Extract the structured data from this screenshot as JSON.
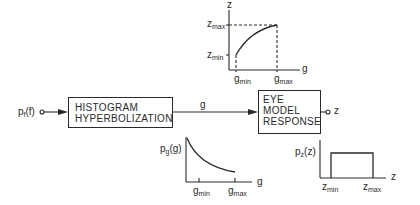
{
  "diagram": {
    "input": {
      "label_main": "p",
      "label_sub": "f",
      "label_arg": "(f)"
    },
    "block1": {
      "line1": "HISTOGRAM",
      "line2": "HYPERBOLIZATION"
    },
    "signal_g": "g",
    "block2": {
      "line1": "EYE",
      "line2": "MODEL",
      "line3": "RESPONSE"
    },
    "output": "z",
    "top_plot": {
      "y_axis": "z",
      "x_axis": "g",
      "z_max": {
        "main": "z",
        "sub": "max"
      },
      "z_min": {
        "main": "z",
        "sub": "min"
      },
      "g_min": {
        "main": "g",
        "sub": "min"
      },
      "g_max": {
        "main": "g",
        "sub": "max"
      }
    },
    "pg_plot": {
      "y_label": {
        "main": "p",
        "sub": "g",
        "arg": "(g)"
      },
      "x_axis": "g",
      "g_min": {
        "main": "g",
        "sub": "min"
      },
      "g_max": {
        "main": "g",
        "sub": "max"
      }
    },
    "pz_plot": {
      "y_label": {
        "main": "p",
        "sub": "z",
        "arg": "(z)"
      },
      "x_axis": "z",
      "z_min": {
        "main": "z",
        "sub": "min"
      },
      "z_max": {
        "main": "z",
        "sub": "max"
      }
    }
  },
  "colors": {
    "ink": "#2a2a2a",
    "background": "#ffffff"
  }
}
